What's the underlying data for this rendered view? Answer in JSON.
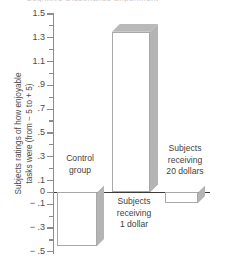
{
  "clipped_title": "Cognitive Dissonance Experiment",
  "chart_data": {
    "type": "bar",
    "title": "",
    "xlabel": "",
    "ylabel": "Subjects ratings of how enjoyable tasks were (from − 5 to + 5)",
    "ylabel_line1": "Subjects ratings of how enjoyable",
    "ylabel_line2": "tasks were (from − 5 to + 5)",
    "categories": [
      "Control group",
      "Subjects receiving 1 dollar",
      "Subjects receiving 20 dollars"
    ],
    "values": [
      -0.45,
      1.35,
      -0.09
    ],
    "ylim": [
      -0.5,
      1.5
    ],
    "ytick_labels": [
      "1.5",
      "1.3",
      "1.1",
      ".9",
      ".7",
      ".5",
      ".3",
      ".1",
      "0",
      "− .1",
      "− .3",
      "− .5"
    ],
    "ytick_values": [
      1.5,
      1.3,
      1.1,
      0.9,
      0.7,
      0.5,
      0.3,
      0.1,
      0.0,
      -0.1,
      -0.3,
      -0.5
    ],
    "yminor_values": [
      1.4,
      1.2,
      1.0,
      0.8,
      0.6,
      0.4,
      0.2,
      -0.2,
      -0.4
    ],
    "grid": false,
    "legend": "none",
    "colors": {
      "bar_face": "#ffffff",
      "bar_edge": "#a8a8a8",
      "bar_side": "#b4b4b4",
      "axis": "#8c8c8c",
      "zero_axis": "#3a3a3a",
      "text": "#4a4a4a"
    }
  },
  "bar_labels": [
    {
      "line1": "Control",
      "line2": "group"
    },
    {
      "line1": "Subjects",
      "line2": "receiving",
      "line3": "1 dollar"
    },
    {
      "line1": "Subjects",
      "line2": "receiving",
      "line3": "20 dollars"
    }
  ]
}
